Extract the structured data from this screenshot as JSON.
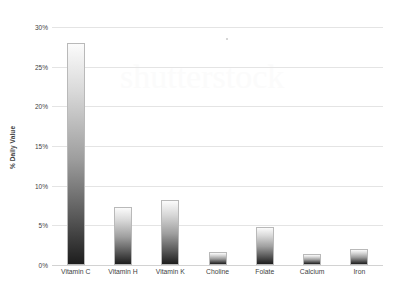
{
  "chart_data": {
    "type": "bar",
    "title": "",
    "xlabel": "",
    "ylabel": "% Daily Value",
    "categories": [
      "Vitamin C",
      "Vitamin H",
      "Vitamin K",
      "Choline",
      "Folate",
      "Calcium",
      "Iron"
    ],
    "values": [
      28.0,
      7.3,
      8.2,
      1.7,
      4.8,
      1.4,
      2.0
    ],
    "ylim": [
      0,
      30
    ],
    "yticks": [
      0,
      5,
      10,
      15,
      20,
      25,
      30
    ],
    "ytick_labels": [
      "0%",
      "5%",
      "10%",
      "15%",
      "20%",
      "25%",
      "30%"
    ],
    "grid": true,
    "legend": false,
    "bar_color": "#8a8a8a",
    "bar_gradient": [
      "#fbfbfb",
      "#1d1d1d"
    ],
    "gridline_color": "#e4e4e4"
  },
  "watermark": {
    "text": "shutterstock"
  }
}
